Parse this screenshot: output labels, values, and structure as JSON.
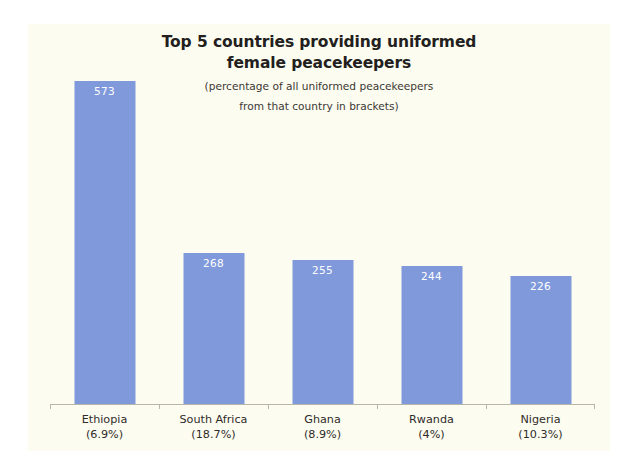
{
  "chart_data": {
    "type": "bar",
    "title": "Top 5 countries providing uniformed female peacekeepers",
    "title_line1": "Top 5 countries providing uniformed",
    "title_line2": "female peacekeepers",
    "subtitle": "(percentage of all uniformed peacekeepers from that country in brackets)",
    "subtitle_line1": "(percentage of all uniformed peacekeepers",
    "subtitle_line2": "from that country in brackets)",
    "categories": [
      "Ethiopia",
      "South Africa",
      "Ghana",
      "Rwanda",
      "Nigeria"
    ],
    "category_sublabels": [
      "(6.9%)",
      "(18.7%)",
      "(8.9%)",
      "(4%)",
      "(10.3%)"
    ],
    "values": [
      573,
      268,
      255,
      244,
      226
    ],
    "percentages": [
      6.9,
      18.7,
      8.9,
      4,
      10.3
    ],
    "xlabel": "",
    "ylabel": "",
    "ylim": [
      0,
      620
    ],
    "grid": false,
    "legend": false,
    "bar_color": "#8099db",
    "value_label_color": "#ffffff",
    "panel_background": "#fdfcf0",
    "axis_color": "#b9b6a8",
    "text_color": "#231f20"
  }
}
